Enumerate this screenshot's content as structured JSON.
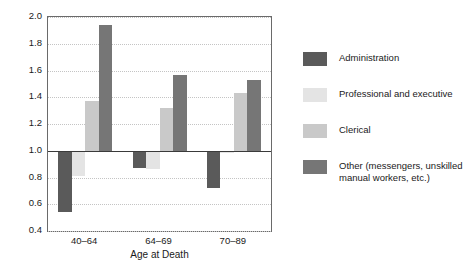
{
  "chart_data": {
    "type": "bar",
    "title": "",
    "subtitle": "",
    "xlabel": "Age at Death",
    "ylabel": "",
    "categories": [
      "40–64",
      "64–69",
      "70–89"
    ],
    "ylim": [
      0.4,
      2.0
    ],
    "ytick_labels": [
      "0.4",
      "0.6",
      "0.8",
      "1.0",
      "1.2",
      "1.4",
      "1.6",
      "1.8",
      "2.0"
    ],
    "ytick_values": [
      0.4,
      0.6,
      0.8,
      1.0,
      1.2,
      1.4,
      1.6,
      1.8,
      2.0
    ],
    "grid": true,
    "grid_style": "dotted-horizontal",
    "reference_line": 1.0,
    "legend_position": "right",
    "series": [
      {
        "name": "Administration",
        "color": "#5a5a5a",
        "values": [
          0.54,
          0.87,
          0.72
        ]
      },
      {
        "name": "Professional and executive",
        "color": "#e4e4e4",
        "values": [
          0.81,
          0.86,
          0.98
        ]
      },
      {
        "name": "Clerical",
        "color": "#c9c9c9",
        "values": [
          1.37,
          1.32,
          1.43
        ]
      },
      {
        "name": "Other (messengers, unskilled\nmanual workers, etc.)",
        "color": "#767676",
        "values": [
          1.94,
          1.57,
          1.53
        ]
      }
    ]
  },
  "axis": {
    "frame_color": "#6a6a6a",
    "baseline_color": "#3a3a3a",
    "gridline_color": "#c4c4c4"
  }
}
